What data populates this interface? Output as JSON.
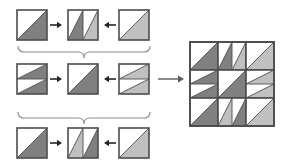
{
  "figure": {
    "title": "",
    "type": "tile-substitution-diagram",
    "colors": {
      "background": "#ffffff",
      "tile_fill": "#ffffff",
      "tile_border": "#4d4d4d",
      "dark_gray": "#808080",
      "light_gray": "#c0c0c0",
      "arrow": "#262626",
      "brace": "#8c8c8c",
      "long_arrow": "#595959"
    },
    "geometry": {
      "tile_size": 30,
      "grid_tile_size": 28,
      "grid_origin": {
        "x": 190,
        "y": 42
      }
    }
  },
  "rows": [
    {
      "name": "row-top",
      "y": 10,
      "tiles": [
        {
          "name": "tile-base-dark",
          "x": 17,
          "kind": "single",
          "cells": [
            {
              "shade": "dark",
              "orient": "lower-right"
            }
          ]
        },
        {
          "name": "tile-vertical-split-dark-light",
          "x": 68,
          "kind": "vertical-split",
          "cells": [
            {
              "shade": "dark",
              "orient": "lower-right"
            },
            {
              "shade": "light",
              "orient": "lower-right"
            }
          ]
        },
        {
          "name": "tile-base-light",
          "x": 119,
          "kind": "single",
          "cells": [
            {
              "shade": "light",
              "orient": "lower-right"
            }
          ]
        }
      ],
      "arrows": [
        {
          "name": "arrow-right-top-left",
          "x": 50,
          "dir": "right"
        },
        {
          "name": "arrow-left-top-right",
          "x": 104,
          "dir": "left"
        }
      ]
    },
    {
      "name": "row-middle",
      "y": 64,
      "tiles": [
        {
          "name": "tile-horizontal-split-dark-dark",
          "x": 17,
          "kind": "horizontal-split",
          "cells": [
            {
              "shade": "dark",
              "orient": "lower-right"
            },
            {
              "shade": "dark",
              "orient": "lower-right"
            }
          ]
        },
        {
          "name": "tile-base-dark-center",
          "x": 68,
          "kind": "single",
          "cells": [
            {
              "shade": "dark",
              "orient": "lower-right"
            }
          ]
        },
        {
          "name": "tile-horizontal-split-light-light",
          "x": 119,
          "kind": "horizontal-split",
          "cells": [
            {
              "shade": "light",
              "orient": "lower-right"
            },
            {
              "shade": "light",
              "orient": "lower-right"
            }
          ]
        }
      ],
      "arrows": [
        {
          "name": "arrow-right-middle-left",
          "x": 50,
          "dir": "right"
        },
        {
          "name": "arrow-left-middle-right",
          "x": 104,
          "dir": "left"
        }
      ]
    },
    {
      "name": "row-bottom",
      "y": 128,
      "tiles": [
        {
          "name": "tile-base-dark-bottom",
          "x": 17,
          "kind": "single",
          "cells": [
            {
              "shade": "dark",
              "orient": "lower-right"
            }
          ]
        },
        {
          "name": "tile-vertical-split-light-dark",
          "x": 68,
          "kind": "vertical-split",
          "cells": [
            {
              "shade": "light",
              "orient": "lower-right"
            },
            {
              "shade": "dark",
              "orient": "lower-right"
            }
          ]
        },
        {
          "name": "tile-base-light-bottom",
          "x": 119,
          "kind": "single",
          "cells": [
            {
              "shade": "light",
              "orient": "lower-right"
            }
          ]
        }
      ],
      "arrows": [
        {
          "name": "arrow-right-bottom-left",
          "x": 50,
          "dir": "right"
        },
        {
          "name": "arrow-left-bottom-right",
          "x": 104,
          "dir": "left"
        }
      ]
    }
  ],
  "braces": [
    {
      "name": "brace-upper",
      "y": 46,
      "x1": 18,
      "x2": 150,
      "mid": 84
    },
    {
      "name": "brace-lower",
      "y": 112,
      "x1": 18,
      "x2": 150,
      "mid": 84
    }
  ],
  "result_arrow": {
    "name": "arrow-to-result",
    "x1": 158,
    "x2": 184,
    "y": 79
  },
  "result_grid": {
    "name": "composite-tile-grid",
    "rows": 3,
    "cols": 3,
    "cells": [
      {
        "name": "grid-cell-0-0",
        "kind": "single",
        "shades": [
          "dark"
        ]
      },
      {
        "name": "grid-cell-0-1",
        "kind": "vertical-split",
        "shades": [
          "dark",
          "light"
        ]
      },
      {
        "name": "grid-cell-0-2",
        "kind": "single",
        "shades": [
          "light"
        ]
      },
      {
        "name": "grid-cell-1-0",
        "kind": "horizontal-split",
        "shades": [
          "dark",
          "dark"
        ]
      },
      {
        "name": "grid-cell-1-1",
        "kind": "single",
        "shades": [
          "dark"
        ]
      },
      {
        "name": "grid-cell-1-2",
        "kind": "horizontal-split",
        "shades": [
          "light",
          "light"
        ]
      },
      {
        "name": "grid-cell-2-0",
        "kind": "single",
        "shades": [
          "dark"
        ]
      },
      {
        "name": "grid-cell-2-1",
        "kind": "vertical-split",
        "shades": [
          "light",
          "dark"
        ]
      },
      {
        "name": "grid-cell-2-2",
        "kind": "single",
        "shades": [
          "light"
        ]
      }
    ]
  }
}
